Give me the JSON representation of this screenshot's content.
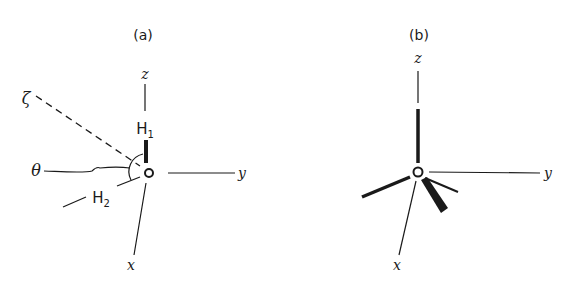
{
  "figure": {
    "panels": [
      {
        "id": "a",
        "label": "(a)",
        "axes": {
          "z": "z",
          "y": "y",
          "x": "x"
        },
        "extra_axis": "ζ",
        "angle": "θ",
        "atoms": {
          "h1": "H",
          "h1_sub": "1",
          "h2": "H",
          "h2_sub": "2"
        }
      },
      {
        "id": "b",
        "label": "(b)",
        "axes": {
          "z": "z",
          "y": "y",
          "x": "x"
        }
      }
    ],
    "colors": {
      "ink": "#1a1a1a",
      "background": "#ffffff"
    }
  }
}
